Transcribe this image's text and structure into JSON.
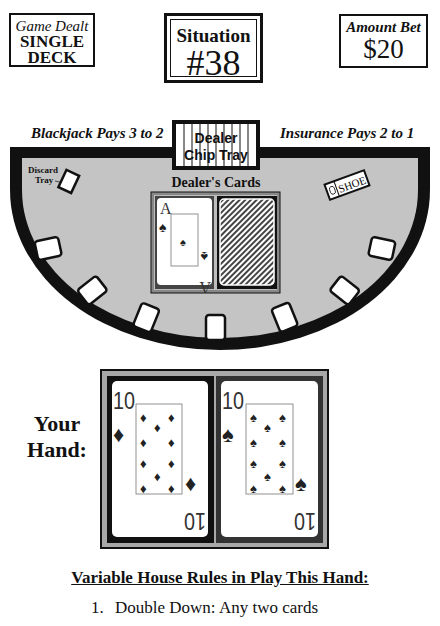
{
  "header": {
    "game": {
      "label": "Game Dealt",
      "value_line1": "SINGLE",
      "value_line2": "DECK"
    },
    "situation": {
      "label": "Situation",
      "value": "#38"
    },
    "bet": {
      "label": "Amount Bet",
      "value": "$20"
    }
  },
  "table": {
    "blackjack_pays": "Blackjack Pays 3 to 2",
    "insurance_pays": "Insurance Pays 2 to 1",
    "chip_tray": {
      "line1": "Dealer",
      "line2": "Chip Tray"
    },
    "discard_tray": {
      "line1": "Discard",
      "line2": "Tray"
    },
    "shoe_label": "SHOE",
    "dealer_cards_label": "Dealer's Cards",
    "felt_color": "#c4c4c4",
    "dealer_cards": [
      {
        "rank": "A",
        "suit": "spade",
        "face_up": true
      },
      {
        "rank": "",
        "suit": "",
        "face_up": false
      }
    ],
    "betting_spots": 7
  },
  "player": {
    "label_line1": "Your",
    "label_line2": "Hand:",
    "cards": [
      {
        "rank": "10",
        "suit": "diamond",
        "face_up": true
      },
      {
        "rank": "10",
        "suit": "spade",
        "face_up": true
      }
    ]
  },
  "rules": {
    "title": "Variable House Rules in Play This Hand:",
    "items": [
      {
        "number": "1.",
        "text": "Double Down: Any two cards"
      }
    ]
  }
}
